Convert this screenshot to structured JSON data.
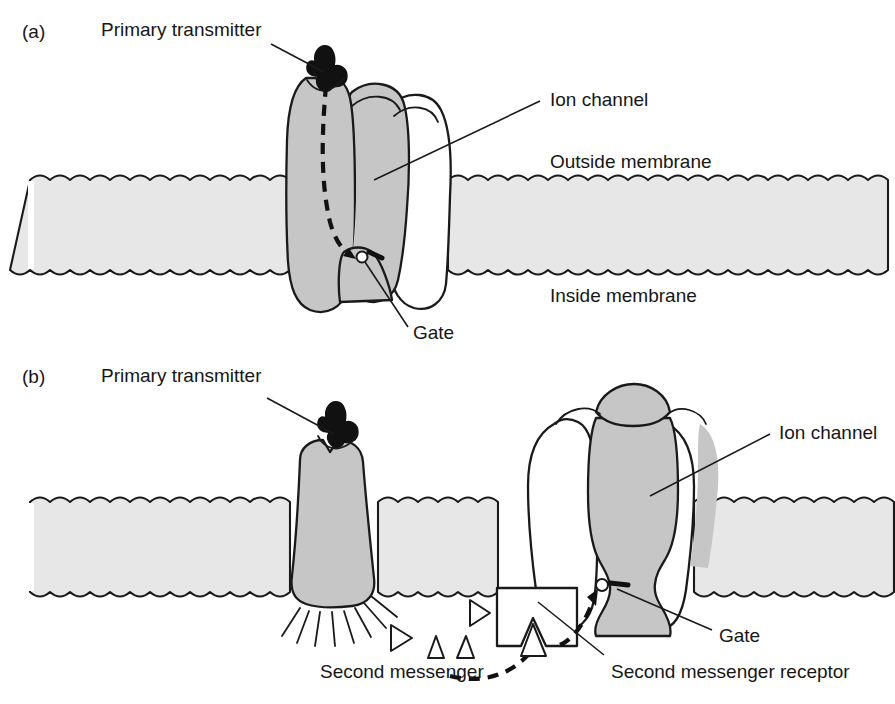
{
  "figure": {
    "background_color": "#ffffff",
    "membrane_fill": "#e7e7e7",
    "protein_fill": "#c6c6c6",
    "channel_white": "#ffffff",
    "transmitter_fill": "#111111",
    "stroke_color": "#1a1a1a"
  },
  "panels": [
    {
      "id": "a",
      "id_label": "(a)",
      "mechanism": "direct ligand-gated channel",
      "labels": [
        {
          "key": "primary_transmitter",
          "text": "Primary transmitter"
        },
        {
          "key": "ion_channel",
          "text": "Ion channel"
        },
        {
          "key": "outside_membrane",
          "text": "Outside membrane"
        },
        {
          "key": "inside_membrane",
          "text": "Inside membrane"
        },
        {
          "key": "gate",
          "text": "Gate"
        }
      ]
    },
    {
      "id": "b",
      "id_label": "(b)",
      "mechanism": "second-messenger-gated channel",
      "labels": [
        {
          "key": "primary_transmitter",
          "text": "Primary transmitter"
        },
        {
          "key": "ion_channel",
          "text": "Ion channel"
        },
        {
          "key": "gate",
          "text": "Gate"
        },
        {
          "key": "second_messenger",
          "text": "Second messenger"
        },
        {
          "key": "second_messenger_receptor",
          "text": "Second messenger receptor"
        }
      ]
    }
  ],
  "elements": {
    "panel_a_id": "(a)",
    "panel_a_primary_transmitter": "Primary transmitter",
    "panel_a_ion_channel": "Ion channel",
    "panel_a_outside_membrane": "Outside membrane",
    "panel_a_inside_membrane": "Inside membrane",
    "panel_a_gate": "Gate",
    "panel_b_id": "(b)",
    "panel_b_primary_transmitter": "Primary transmitter",
    "panel_b_ion_channel": "Ion channel",
    "panel_b_gate": "Gate",
    "panel_b_second_messenger": "Second messenger",
    "panel_b_second_messenger_receptor": "Second messenger receptor"
  },
  "counts": {
    "second_messenger_triangles": 4,
    "radiating_rays": 8
  }
}
